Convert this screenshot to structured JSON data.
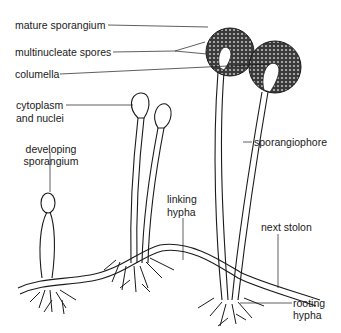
{
  "labels": {
    "mature_sporangium": "mature sporangium",
    "multinucleate_spores": "multinucleate spores",
    "columella": "columella",
    "cytoplasm_nuclei_1": "cytoplasm",
    "cytoplasm_nuclei_2": "and nuclei",
    "developing_sporangium_1": "developing",
    "developing_sporangium_2": "sporangium",
    "sporangiophore": "sporangiophore",
    "linking_hypha_1": "linking",
    "linking_hypha_2": "hypha",
    "next_stolon": "next stolon",
    "rooting_hypha_1": "rooting",
    "rooting_hypha_2": "hypha"
  },
  "colors": {
    "ink": "#1a1a1a",
    "sporangium_fill": "#555555"
  }
}
